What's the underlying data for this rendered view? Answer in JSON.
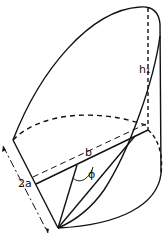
{
  "diagram": {
    "type": "geometric-solid",
    "labels": {
      "height": "h₁",
      "width": "b",
      "thickness": "2a",
      "angle": "ϕ"
    },
    "colors": {
      "stroke": "#111111",
      "background": "#ffffff"
    }
  }
}
